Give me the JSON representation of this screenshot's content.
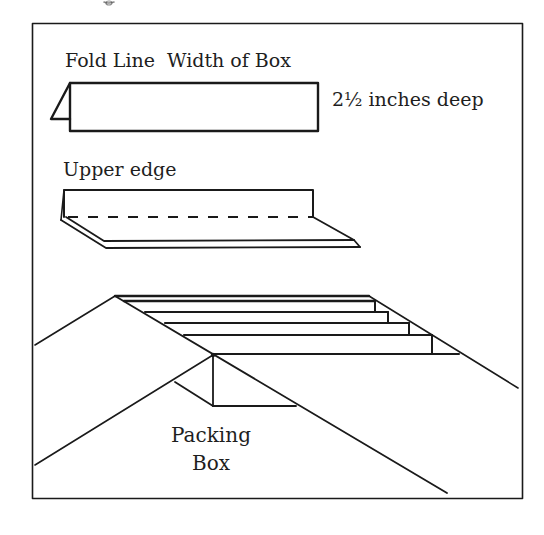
{
  "figure": {
    "labels": {
      "fold_line": "Fold Line",
      "width_of_box": "Width of Box",
      "depth": "2½ inches deep",
      "upper_edge": "Upper edge",
      "packing": "Packing",
      "box": "Box"
    },
    "colors": {
      "ink": "#1a1a1a",
      "background": "#ffffff"
    },
    "panels": [
      {
        "name": "folded-strip",
        "description": "Rectangle strip with fold flap"
      },
      {
        "name": "upper-edge-strip",
        "description": "Strip folded along dashed line"
      },
      {
        "name": "packing-box-roof",
        "description": "Strips stacked on roof slope with packing box"
      }
    ]
  }
}
